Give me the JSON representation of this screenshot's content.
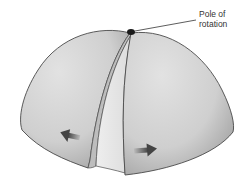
{
  "diagram": {
    "labels": {
      "pole_line1": "Pole of",
      "pole_line2": "rotation"
    },
    "arrows": [
      {
        "direction": "left",
        "meaning": "plate motion away from rift"
      },
      {
        "direction": "right",
        "meaning": "plate motion away from rift"
      }
    ],
    "colors": {
      "dome_fill": "#d4d4d4",
      "dome_shadow": "#a9a9a9",
      "outline": "#4a4a4a",
      "pole_dot": "#1a1a1a",
      "arrow": "#555555"
    }
  }
}
